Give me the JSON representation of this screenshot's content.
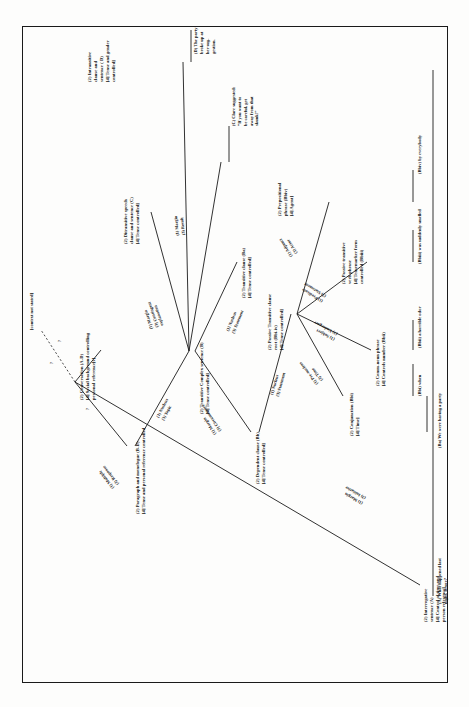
{
  "figure": {
    "type": "tagmemic-hierarchy-tree",
    "orientation": "rotated-90-ccw",
    "context_note": "[context not stated]",
    "nodes": [
      {
        "id": "n-conversation",
        "label": "(2) Conversation (A-D)\n[4] Social background controlling\npersonal reference[s]"
      },
      {
        "id": "n-paragraph",
        "label": "(2) Paragraph and monologue (B-D)\n[4] Tense and personal reference controlled"
      },
      {
        "id": "n-interrogative",
        "label": "(2) Interrogative\nsentence (A)\n[4] Control of time and\nperson reference]"
      },
      {
        "id": "n-transitive-complex",
        "label": "(2) Transitive Complex sentence (B)\n[4] Tense controlled]"
      },
      {
        "id": "n-ditransitive",
        "label": "(2) Ditransitive speech\nclause and sentence (C)\n[4] Tense controlled]"
      },
      {
        "id": "n-intransitive",
        "label": "(2) Intransitive\nclause and\nsentence ( D)\n[4] Tense and gender\ncontrolled]"
      },
      {
        "id": "n-transitive-clause",
        "label": "(2) Transitive clause (Ba)\n[4] Tense controlled]"
      },
      {
        "id": "n-dependent",
        "label": "(2) Dependent clause (Bb)\n[4] Tense controlled]"
      },
      {
        "id": "n-passive-root",
        "label": "(2) Passive Transitive clause\nroot (Bbi-iv)\n[4] Tense controlled]"
      },
      {
        "id": "n-conjunction",
        "label": "(2) Conjunction (Bbi)\n[4] Time]"
      },
      {
        "id": "n-comm-noun",
        "label": "(2) Comm-noun phrase\n[4] Controls number (Bbii)"
      },
      {
        "id": "n-passive-verb",
        "label": "(2) Passive transitive\nverb phrase\n[4] Tensemarker form\ncontrolled (Bbiii)"
      },
      {
        "id": "n-prepositional",
        "label": "(2) Prepositional\nphrase (Bbiv)\n[4] Agent]"
      }
    ],
    "link_labels": [
      {
        "id": "l-multiple-response",
        "label": "(1) Multiple\n(3) Response"
      },
      {
        "id": "l-nucleus-topic",
        "label": "(1) Nucleus\n(3) Topic"
      },
      {
        "id": "l-margin-initiative",
        "label": "(1) Margin\n(3) Initiative"
      },
      {
        "id": "l-margin-contingent",
        "label": "(1) Margin\n(3) Contingent\nexplanation"
      },
      {
        "id": "l-margin-result",
        "label": "(1) Margin\n(3) Result"
      },
      {
        "id": "l-nucleus-statement-a",
        "label": "(1) Nucleus\n(3) Statement"
      },
      {
        "id": "l-margin-circumstance",
        "label": "(1) Margin\n(3) Circumstance"
      },
      {
        "id": "l-nucleus-statement-b",
        "label": "(1) Nucleus\n(3) Statement"
      },
      {
        "id": "l-prenucleus-time",
        "label": "(1) Pre-nucleus\n(3) Time"
      },
      {
        "id": "l-subject-undergoer",
        "label": "(1) Subject\n(3) Undergoer"
      },
      {
        "id": "l-predicate-statement",
        "label": "(1) Predicate\n(3) Statement"
      },
      {
        "id": "l-adjunct-actor",
        "label": "(1) Adjunct\n(3) Actor"
      }
    ],
    "terminals": [
      {
        "id": "t-a",
        "label": "(A) What happened last\nnight, Bruce?"
      },
      {
        "id": "t-ba",
        "label": "(Ba) We were having a party"
      },
      {
        "id": "t-bbi",
        "label": "(Bbi) when"
      },
      {
        "id": "t-bbii",
        "label": "(Bbii) a horrible odor"
      },
      {
        "id": "t-bbiii",
        "label": "(Bbiii) was suddenly smelled"
      },
      {
        "id": "t-bbiv",
        "label": "(Bbiv) by everybody"
      },
      {
        "id": "t-c",
        "label": "(C) Clare suggested:\n“If you want to\nbe careful, get\naway from that\nskunk!”"
      },
      {
        "id": "t-d",
        "label": "(D) The party\nbroke up at\nher sug-\ngestion."
      }
    ],
    "query_marks": [
      "?",
      "?",
      "?"
    ],
    "colors": {
      "ink": "#1b1b1b",
      "paper": "#fdfdfc"
    }
  }
}
